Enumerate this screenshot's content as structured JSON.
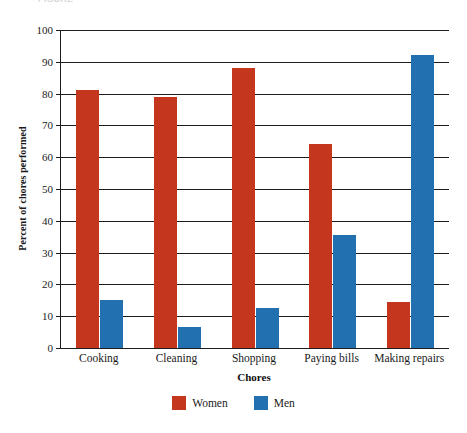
{
  "chart_data": {
    "type": "bar",
    "title": "",
    "xlabel": "Chores",
    "ylabel": "Percent of chores performed",
    "categories": [
      "Cooking",
      "Cleaning",
      "Shopping",
      "Paying bills",
      "Making repairs"
    ],
    "series": [
      {
        "name": "Women",
        "color": "#c4361e",
        "values": [
          81,
          79,
          88,
          64,
          14.5
        ]
      },
      {
        "name": "Men",
        "color": "#2270b0",
        "values": [
          15,
          6.5,
          12.5,
          35.5,
          92
        ]
      }
    ],
    "ylim": [
      0,
      100
    ],
    "ytick_step": 10,
    "yticks": [
      "0",
      "10",
      "20",
      "30",
      "40",
      "50",
      "60",
      "70",
      "80",
      "90",
      "100"
    ],
    "grid": "horizontal",
    "legend_position": "bottom-center",
    "bar_orientation": "vertical",
    "grouped": true
  },
  "axes": {
    "y_title": "Percent of chores performed",
    "x_title": "Chores"
  },
  "legend": {
    "items": [
      {
        "label": "Women",
        "color": "#c4361e"
      },
      {
        "label": "Men",
        "color": "#2270b0"
      }
    ]
  },
  "cropped_header": {
    "text": "FIGURE"
  },
  "colors": {
    "women": "#c4361e",
    "men": "#2270b0",
    "axis": "#1d1d1d",
    "text": "#1a1a1a",
    "background": "#ffffff"
  }
}
